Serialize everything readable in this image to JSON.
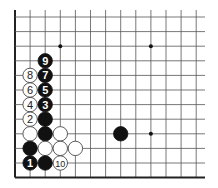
{
  "diagram": {
    "type": "go-board-corner",
    "grid": {
      "x0": 15,
      "dx": 15.1,
      "cols": 13,
      "y0": 17,
      "dy": 14.6,
      "rows": 12,
      "top_extend": 10,
      "right_extend": 205,
      "line_color": "#555555",
      "edge_color": "#222222"
    },
    "star_points": [
      [
        3,
        2
      ],
      [
        9,
        2
      ],
      [
        9,
        8
      ]
    ],
    "stones": [
      {
        "col": 2,
        "row": 3,
        "color": "black",
        "label": "9"
      },
      {
        "col": 1,
        "row": 4,
        "color": "white",
        "label": "8"
      },
      {
        "col": 2,
        "row": 4,
        "color": "black",
        "label": "7"
      },
      {
        "col": 1,
        "row": 5,
        "color": "white",
        "label": "6"
      },
      {
        "col": 2,
        "row": 5,
        "color": "black",
        "label": "5"
      },
      {
        "col": 1,
        "row": 6,
        "color": "white",
        "label": "4"
      },
      {
        "col": 2,
        "row": 6,
        "color": "black",
        "label": "3"
      },
      {
        "col": 1,
        "row": 7,
        "color": "white",
        "label": "2"
      },
      {
        "col": 2,
        "row": 7,
        "color": "black",
        "label": ""
      },
      {
        "col": 1,
        "row": 8,
        "color": "white",
        "label": ""
      },
      {
        "col": 2,
        "row": 8,
        "color": "black",
        "label": ""
      },
      {
        "col": 3,
        "row": 8,
        "color": "white",
        "label": ""
      },
      {
        "col": 7,
        "row": 8,
        "color": "black",
        "label": ""
      },
      {
        "col": 1,
        "row": 9,
        "color": "black",
        "label": ""
      },
      {
        "col": 2,
        "row": 9,
        "color": "white",
        "label": ""
      },
      {
        "col": 3,
        "row": 9,
        "color": "white",
        "label": ""
      },
      {
        "col": 4,
        "row": 9,
        "color": "white",
        "label": ""
      },
      {
        "col": 1,
        "row": 10,
        "color": "black",
        "label": "1"
      },
      {
        "col": 2,
        "row": 10,
        "color": "black",
        "label": ""
      },
      {
        "col": 3,
        "row": 10,
        "color": "white",
        "label": "10"
      }
    ],
    "colors": {
      "black_stone": "#111111",
      "white_stone": "#ffffff",
      "white_outline": "#333333"
    }
  }
}
